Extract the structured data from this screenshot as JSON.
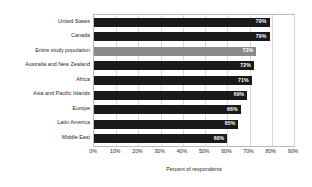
{
  "chart_data": {
    "type": "bar",
    "orientation": "horizontal",
    "title": "",
    "xlabel": "Percent of respondents",
    "ylabel": "",
    "xlim": [
      0,
      90
    ],
    "xticks": [
      "0%",
      "10%",
      "20%",
      "30%",
      "40%",
      "50%",
      "60%",
      "70%",
      "80%",
      "90%"
    ],
    "xtick_values": [
      0,
      10,
      20,
      30,
      40,
      50,
      60,
      70,
      80,
      90
    ],
    "grid": true,
    "legend": "none",
    "categories": [
      "United States",
      "Canada",
      "Entire study population",
      "Australia and New Zealand",
      "Africa",
      "Asia and Pacific Islands",
      "Europe",
      "Latin America",
      "Middle East"
    ],
    "values": [
      79,
      79,
      73,
      72,
      71,
      69,
      66,
      65,
      60
    ],
    "value_labels": [
      "79%",
      "79%",
      "73%",
      "72%",
      "71%",
      "69%",
      "66%",
      "65%",
      "60%"
    ],
    "highlight_index": 2,
    "colors": {
      "bar": "#1a1a1a",
      "highlight_bar": "#8a8a8a",
      "value_label": "#ffffff",
      "gridline": "#d8d8d8",
      "frame": "#b9b9b9",
      "text": "#2b2b2b",
      "background": "#ffffff"
    }
  }
}
